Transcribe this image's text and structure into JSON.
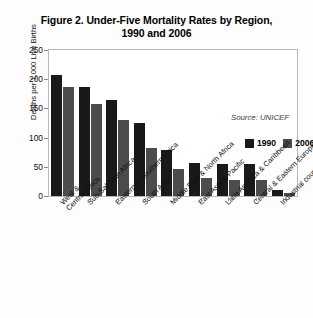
{
  "figure": {
    "title_line1": "Figure 2. Under-Five Mortality Rates by Region,",
    "title_line2": "1990 and 2006",
    "source_note": "Source: UNICEF"
  },
  "legend": {
    "entries": [
      {
        "label": "1990",
        "color": "#191919"
      },
      {
        "label": "2006",
        "color": "#4c4c4c"
      }
    ]
  },
  "axis": {
    "y_title": "Deaths per 1,000 Live Births",
    "y_ticks": [
      "250",
      "200",
      "150",
      "100",
      "50",
      "0"
    ]
  },
  "chart_data": {
    "type": "bar",
    "title": "Figure 2. Under-Five Mortality Rates by Region, 1990 and 2006",
    "xlabel": "",
    "ylabel": "Deaths per 1,000 Live Births",
    "ylim": [
      0,
      250
    ],
    "ytick_step": 50,
    "grid": false,
    "legend_position": "upper right inside plot",
    "annotations": [
      "Source: UNICEF"
    ],
    "categories": [
      "West & Central Africa",
      "Sub-Saharan Africa",
      "Eastern & Southern Africa",
      "South Asia",
      "Middle East & North Africa",
      "East Asia & Pacific",
      "Latin America & Caribbean",
      "Central & Eastern Europe/CIS",
      "Industrial countries"
    ],
    "category_lines": [
      [
        "West &",
        "Central Africa"
      ],
      [
        "Sub-Saharan Africa"
      ],
      [
        "Eastern & Southern Africa"
      ],
      [
        "South Asia"
      ],
      [
        "Middle East & North Africa"
      ],
      [
        "East Asia & Pacific"
      ],
      [
        "Latin America & Caribbean"
      ],
      [
        "Central & Eastern Europe/CIS"
      ],
      [
        "Industrial countries"
      ]
    ],
    "series": [
      {
        "name": "1990",
        "color": "#191919",
        "values": [
          208,
          187,
          165,
          125,
          79,
          56,
          55,
          54,
          10
        ]
      },
      {
        "name": "2006",
        "color": "#4c4c4c",
        "values": [
          186,
          157,
          131,
          83,
          46,
          31,
          27,
          28,
          6
        ]
      }
    ]
  }
}
